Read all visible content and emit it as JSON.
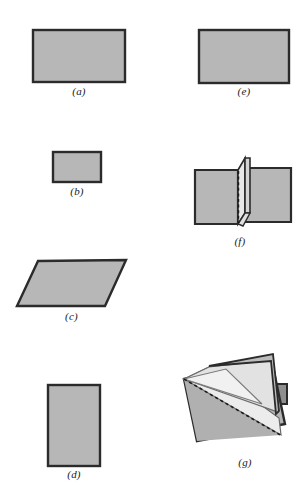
{
  "figure": {
    "background_color": "#ffffff",
    "palette": {
      "paper_gray": "#b7b7b7",
      "paper_gray_light": "#c2c2c2",
      "flap_light": "#e8e8e8",
      "flap_mid": "#d4d4d4",
      "flap_pale": "#f1f1f1",
      "edge_dark": "#2b2b2b",
      "edge_mid": "#555555",
      "fold_dash": "#1a1a1a",
      "label_color": "#1a1a1a"
    },
    "panels": [
      {
        "id": "a",
        "label": "(a)",
        "shape": "rectangle",
        "orientation": "landscape",
        "fill": "#b7b7b7",
        "stroke": "#2b2b2b",
        "column": "left",
        "row": 1,
        "x": 33,
        "y": 30,
        "width": 92,
        "height": 52,
        "label_x": 33,
        "label_y": 88,
        "label_width": 92
      },
      {
        "id": "b",
        "label": "(b)",
        "shape": "rectangle",
        "orientation": "landscape-small",
        "fill": "#b7b7b7",
        "stroke": "#2b2b2b",
        "column": "left",
        "row": 2,
        "x": 53,
        "y": 152,
        "width": 48,
        "height": 30,
        "label_x": 53,
        "label_y": 186,
        "label_width": 48
      },
      {
        "id": "c",
        "label": "(c)",
        "shape": "parallelogram",
        "orientation": "skewed",
        "fill": "#b7b7b7",
        "stroke": "#2b2b2b",
        "column": "left",
        "row": 3,
        "points": "38,261 126,260 105,306 17,306",
        "label_x": 17,
        "label_y": 312,
        "label_width": 109
      },
      {
        "id": "d",
        "label": "(d)",
        "shape": "rectangle",
        "orientation": "portrait",
        "fill": "#b7b7b7",
        "stroke": "#2b2b2b",
        "column": "left",
        "row": 4,
        "x": 48,
        "y": 385,
        "width": 52,
        "height": 81,
        "label_x": 48,
        "label_y": 470,
        "label_width": 52
      },
      {
        "id": "e",
        "label": "(e)",
        "shape": "rectangle",
        "orientation": "landscape",
        "fill": "#b7b7b7",
        "stroke": "#2b2b2b",
        "column": "right",
        "row": 1,
        "x": 199,
        "y": 30,
        "width": 90,
        "height": 53,
        "label_x": 199,
        "label_y": 88,
        "label_width": 90
      },
      {
        "id": "f",
        "label": "(f)",
        "shape": "folded-sheet-vertical-crease",
        "description": "Two gray panels joined by a light upright folded flap with a vertical dashed crease",
        "fill": "#b7b7b7",
        "flap_fill": "#e8e8e8",
        "stroke": "#2b2b2b",
        "dash_color": "#1a1a1a",
        "column": "right",
        "row": 2,
        "label_x": 185,
        "label_y": 238,
        "label_width": 110
      },
      {
        "id": "g",
        "label": "(g)",
        "shape": "folded-sheet-diagonal-crease",
        "description": "Tilted gray sheet with two pale triangular flaps folded over and a diagonal dashed crease",
        "fill": "#b5b5b5",
        "flap_fill": "#ececec",
        "flap_fill_alt": "#dcdcdc",
        "stroke": "#2b2b2b",
        "dash_color": "#1a1a1a",
        "column": "right",
        "row": 4,
        "label_x": 205,
        "label_y": 460,
        "label_width": 80
      }
    ]
  }
}
